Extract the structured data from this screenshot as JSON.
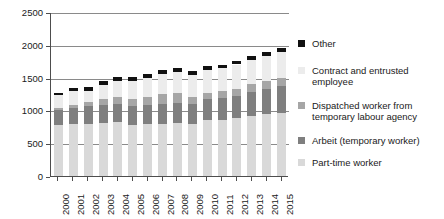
{
  "chart_data": {
    "type": "bar",
    "stacked": true,
    "title": "",
    "subtitle": "",
    "xlabel": "",
    "ylabel": "",
    "ylim": [
      0,
      2500
    ],
    "yticks": [
      0,
      500,
      1000,
      1500,
      2000,
      2500
    ],
    "ytick_labels": [
      "0",
      "500",
      "1000",
      "1500",
      "2000",
      "2500"
    ],
    "grid": true,
    "grid_axis": "y",
    "legend_position": "right",
    "categories": [
      "2000",
      "2001",
      "2002",
      "2003",
      "2004",
      "2005",
      "2006",
      "2007",
      "2008",
      "2009",
      "2010",
      "2011",
      "2012",
      "2013",
      "2014",
      "2015"
    ],
    "series": [
      {
        "name": "Part-time worker",
        "color": "#d9d9d9",
        "values": [
          780,
          790,
          800,
          810,
          820,
          780,
          790,
          800,
          810,
          800,
          850,
          860,
          880,
          920,
          940,
          960
        ]
      },
      {
        "name": "Arbeit (temporary worker)",
        "color": "#7f7f7f",
        "values": [
          230,
          250,
          260,
          270,
          280,
          280,
          290,
          300,
          310,
          300,
          320,
          330,
          340,
          360,
          390,
          410
        ]
      },
      {
        "name": "Dispatched worker from temporary labour agency",
        "color": "#a6a6a6",
        "values": [
          30,
          50,
          70,
          90,
          100,
          110,
          130,
          150,
          140,
          110,
          100,
          100,
          110,
          120,
          120,
          130
        ]
      },
      {
        "name": "Contract and entrusted employee",
        "color": "#ececec",
        "values": [
          190,
          200,
          160,
          220,
          250,
          280,
          290,
          310,
          320,
          330,
          340,
          350,
          370,
          370,
          380,
          390
        ]
      },
      {
        "name": "Other",
        "color": "#111111",
        "values": [
          40,
          50,
          60,
          60,
          60,
          60,
          60,
          60,
          60,
          60,
          60,
          60,
          60,
          60,
          60,
          60
        ]
      }
    ],
    "totals": [
      1270,
      1340,
      1350,
      1450,
      1510,
      1510,
      1560,
      1620,
      1640,
      1600,
      1670,
      1700,
      1760,
      1830,
      1890,
      1950
    ]
  },
  "legend": {
    "entries": [
      {
        "label": "Other"
      },
      {
        "label": "Contract and entrusted\nemployee"
      },
      {
        "label": "Dispatched worker from\ntemporary labour agency"
      },
      {
        "label": "Arbeit (temporary worker)"
      },
      {
        "label": "Part-time worker"
      }
    ]
  }
}
